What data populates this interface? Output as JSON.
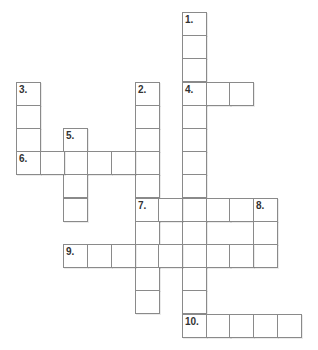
{
  "puzzle": {
    "type": "crossword",
    "grid_origin": {
      "x": 16,
      "y": 12
    },
    "cell_w": 23.7,
    "cell_h": 23.2,
    "entries": [
      {
        "number": "1.",
        "direction": "down",
        "row": 0,
        "col": 7,
        "length": 14
      },
      {
        "number": "2.",
        "direction": "down",
        "row": 3,
        "col": 5,
        "length": 10
      },
      {
        "number": "3.",
        "direction": "down",
        "row": 3,
        "col": 0,
        "length": 4
      },
      {
        "number": "4.",
        "direction": "across",
        "row": 3,
        "col": 7,
        "length": 3
      },
      {
        "number": "5.",
        "direction": "down",
        "row": 5,
        "col": 2,
        "length": 4
      },
      {
        "number": "6.",
        "direction": "across",
        "row": 6,
        "col": 0,
        "length": 6
      },
      {
        "number": "7.",
        "direction": "across",
        "row": 8,
        "col": 5,
        "length": 6
      },
      {
        "number": "8.",
        "direction": "down",
        "row": 8,
        "col": 10,
        "length": 3
      },
      {
        "number": "9.",
        "direction": "across",
        "row": 10,
        "col": 2,
        "length": 9
      },
      {
        "number": "10.",
        "direction": "across",
        "row": 13,
        "col": 7,
        "length": 5
      }
    ]
  }
}
